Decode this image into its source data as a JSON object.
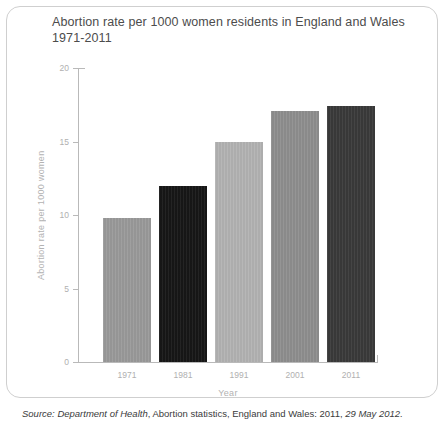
{
  "card": {
    "title": "Abortion rate per 1000 women residents in England and Wales 1971-2011"
  },
  "source": {
    "lead": "Source: Department of Health",
    "middle": ", Abortion statistics, England and Wales: 2011, ",
    "date": "29 May 2012."
  },
  "chart_data": {
    "type": "bar",
    "title": "Abortion rate per 1000 women residents in England and Wales 1971-2011",
    "xlabel": "Year",
    "ylabel": "Abortion rate per 1000 women",
    "categories": [
      "1971",
      "1981",
      "1991",
      "2001",
      "2011"
    ],
    "values": [
      9.8,
      12.0,
      15.0,
      17.1,
      17.4
    ],
    "bar_colors": [
      "#9a9a9a",
      "#171717",
      "#b3b3b3",
      "#8f8f8f",
      "#3a3a3a"
    ],
    "ylim": [
      0,
      20
    ],
    "yticks": [
      0,
      5,
      10,
      15,
      20
    ],
    "ytick_labels": [
      "0",
      "5",
      "10",
      "15",
      "20"
    ],
    "grid": false,
    "legend": "none"
  }
}
